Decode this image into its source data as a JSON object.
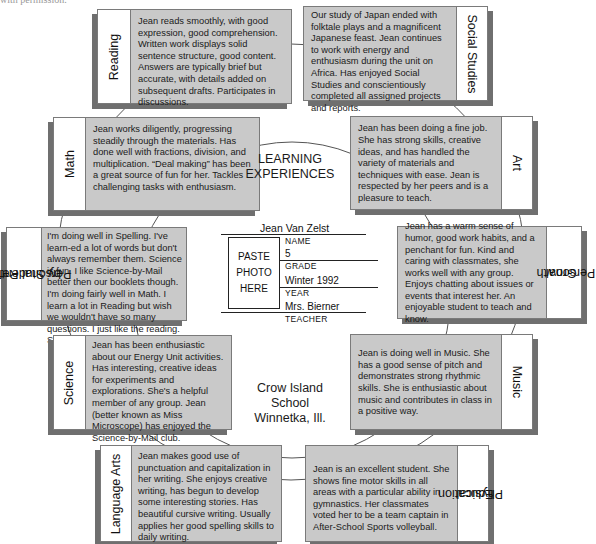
{
  "page_fragment": "with permission.",
  "center": {
    "title_line1": "LEARNING",
    "title_line2": "EXPERIENCES",
    "school_line1": "Crow Island",
    "school_line2": "School",
    "school_line3": "Winnetka, Ill."
  },
  "student_info": {
    "photo_line1": "PASTE",
    "photo_line2": "PHOTO",
    "photo_line3": "HERE",
    "name_value": "Jean Van Zelst",
    "name_caption": "NAME",
    "grade_value": "5",
    "grade_caption": "GRADE",
    "year_value": "Winter 1992",
    "year_caption": "YEAR",
    "teacher_value": "Mrs. Bierner",
    "teacher_caption": "TEACHER"
  },
  "subjects": {
    "reading": {
      "label": "Reading",
      "comment": "Jean reads smoothly, with good expression, good comprehension. Written work displays solid sentence structure, good content. Answers are typically brief but accurate, with details added on subsequent drafts. Participates in discussions."
    },
    "social_studies": {
      "label": "Social Studies",
      "comment": "Our study of Japan ended with folktale plays and a magnificent Japanese feast. Jean continues to work with energy and enthusiasm during the unit on Africa. Has enjoyed Social Studies and conscientiously completed all assigned projects and reports."
    },
    "math": {
      "label": "Math",
      "comment": "Jean works diligently, progressing steadily through the materials. Has done well with fractions, division, and multiplication. “Deal making” has been a great source of fun for her. Tackles challenging tasks with enthusiasm."
    },
    "art": {
      "label": "Art",
      "comment": "Jean has been doing a fine job. She has strong skills, creative ideas, and has handled the variety of materials and techniques with ease. Jean is respected by her peers and is a pleasure to teach."
    },
    "personal_reflection": {
      "label_line1": "Personal Reflection",
      "label_line2": "by Student",
      "comment": "I'm doing well in Spelling. I've learn-ed a lot of words but don't always remember them. Science is fun. I like Science-by-Mail better then our booklets though. I'm doing fairly well in Math. I learn a lot in Reading but wish we wouldn't have so many questions. I just like the reading. Social Studies is my favorite."
    },
    "personal_growth": {
      "label_line1": "Personal",
      "label_line2": "Growth",
      "comment": "Jean has a warm sense of humor, good work habits, and a penchant for fun. Kind and caring with classmates, she works well with any group. Enjoys chatting about issues or events that interest her. An enjoyable student to teach and know."
    },
    "science": {
      "label": "Science",
      "comment": "Jean has been enthusiastic about our Energy Unit activities. Has interesting, creative ideas for experiments and explorations. She's a helpful member of any group. Jean (better known as Miss Microscope) has enjoyed the Science-by-Mail club."
    },
    "music": {
      "label": "Music",
      "comment": "Jean is doing well in Music. She has a good sense of pitch and demonstrates strong rhythmic skills. She is enthusiastic about music and contributes in class in a positive way."
    },
    "language_arts": {
      "label": "Language Arts",
      "comment": "Jean makes good use of punctuation and capitalization in her writing. She enjoys creative writing, has begun to develop some interesting stories. Has beautiful cursive writing. Usually applies her good spelling skills to daily writing."
    },
    "physical_education": {
      "label_line1": "Physical",
      "label_line2": "Education",
      "comment": "Jean is an excellent student. She shows fine motor skills in all areas with a particular ability in gymnastics. Her classmates voted her to be a team captain in After-School Sports volleyball."
    }
  }
}
